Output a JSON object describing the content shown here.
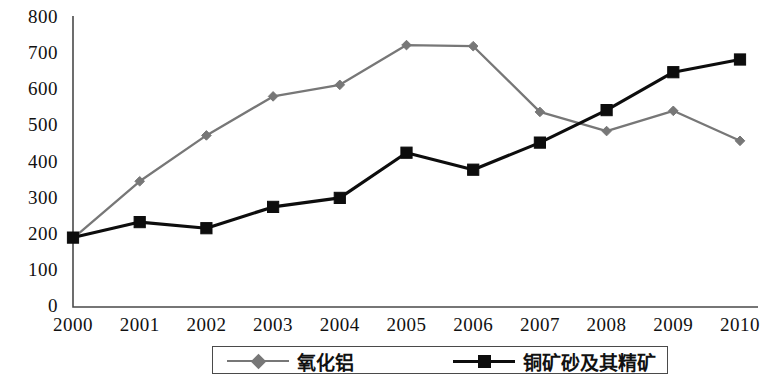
{
  "chart_data": {
    "type": "line",
    "title": "",
    "xlabel": "",
    "ylabel": "",
    "categories": [
      "2000",
      "2001",
      "2002",
      "2003",
      "2004",
      "2005",
      "2006",
      "2007",
      "2008",
      "2009",
      "2010"
    ],
    "ylim": [
      0,
      800
    ],
    "ytick_step": 100,
    "yticks": [
      "800",
      "700",
      "600",
      "500",
      "400",
      "300",
      "200",
      "100",
      "0"
    ],
    "grid": false,
    "legend_position": "bottom",
    "series": [
      {
        "name": "氧化铝",
        "color": "#777777",
        "marker": "diamond",
        "values": [
          190,
          348,
          475,
          583,
          615,
          725,
          722,
          540,
          487,
          543,
          460
        ]
      },
      {
        "name": "铜矿砂及其精矿",
        "color": "#0d0d0d",
        "marker": "square",
        "values": [
          192,
          235,
          218,
          277,
          302,
          427,
          380,
          455,
          545,
          650,
          685
        ]
      }
    ]
  },
  "axis": {
    "y_labels": [
      "800",
      "700",
      "600",
      "500",
      "400",
      "300",
      "200",
      "100",
      "0"
    ],
    "x_labels": [
      "2000",
      "2001",
      "2002",
      "2003",
      "2004",
      "2005",
      "2006",
      "2007",
      "2008",
      "2009",
      "2010"
    ],
    "axis_color": "#4a4a4a"
  },
  "legend": {
    "items": [
      {
        "label": "氧化铝",
        "color": "#777777",
        "marker": "diamond"
      },
      {
        "label": "铜矿砂及其精矿",
        "color": "#0d0d0d",
        "marker": "square"
      }
    ]
  }
}
